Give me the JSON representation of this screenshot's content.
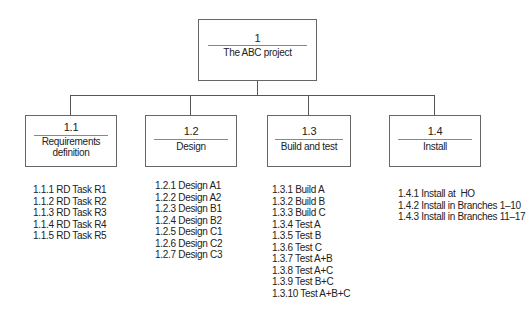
{
  "root": {
    "number": "1",
    "label": "The ABC project"
  },
  "children": [
    {
      "number": "1.1",
      "label": "Requirements definition",
      "tasks": [
        "1.1.1 RD Task R1",
        "1.1.2 RD Task R2",
        "1.1.3 RD Task R3",
        "1.1.4 RD Task R4",
        "1.1.5 RD Task R5"
      ]
    },
    {
      "number": "1.2",
      "label": "Design",
      "tasks": [
        "1.2.1 Design A1",
        "1.2.2 Design A2",
        "1.2.3 Design B1",
        "1.2.4 Design B2",
        "1.2.5 Design C1",
        "1.2.6 Design C2",
        "1.2.7 Design C3"
      ]
    },
    {
      "number": "1.3",
      "label": "Build and test",
      "tasks": [
        "1.3.1 Build A",
        "1.3.2 Build B",
        "1.3.3 Build C",
        "1.3.4 Test A",
        "1.3.5 Test B",
        "1.3.6 Test C",
        "1.3.7 Test A+B",
        "1.3.8 Test A+C",
        "1.3.9 Test B+C",
        "1.3.10 Test A+B+C"
      ]
    },
    {
      "number": "1.4",
      "label": "Install",
      "tasks": [
        "1.4.1 Install at  HO",
        "1.4.2 Install in Branches 1–10",
        "1.4.3 Install in Branches 11–17"
      ]
    }
  ],
  "colors": {
    "line": "#555555",
    "border": "#666666",
    "text": "#222222"
  }
}
